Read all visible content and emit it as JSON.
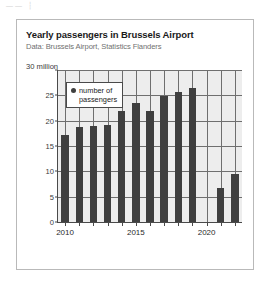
{
  "artifact": {
    "text": "——  ┆"
  },
  "chart_data": {
    "type": "bar",
    "title": "Yearly passengers in Brussels Airport",
    "subtitle": "Data: Brussels Airport, Statistics Flanders",
    "xlabel": "",
    "ylabel": "",
    "y_axis_unit_label": "30 million",
    "legend": {
      "position": "top-left-inside",
      "entries": [
        {
          "label_line1": "number of",
          "label_line2": "passengers",
          "marker": "dot",
          "color": "#3f3f3f"
        }
      ]
    },
    "categories": [
      2010,
      2011,
      2012,
      2013,
      2014,
      2015,
      2016,
      2017,
      2018,
      2019,
      2020,
      2021,
      2022
    ],
    "values": [
      17.2,
      18.8,
      18.9,
      19.1,
      22.0,
      23.5,
      21.9,
      24.8,
      25.7,
      26.4,
      0,
      6.8,
      9.5
    ],
    "series": [
      {
        "name": "number of passengers",
        "color": "#3f3f3f",
        "values": [
          17.2,
          18.8,
          18.9,
          19.1,
          22.0,
          23.5,
          21.9,
          24.8,
          25.7,
          26.4,
          0,
          6.8,
          9.5
        ]
      }
    ],
    "ylim": [
      0,
      30
    ],
    "yticks": [
      0,
      5,
      10,
      15,
      20,
      25,
      30
    ],
    "ytick_labels": [
      "0",
      "5",
      "10",
      "15",
      "20",
      "25",
      "30 million"
    ],
    "xticks": [
      2010,
      2015,
      2020
    ],
    "xtick_labels": [
      "2010",
      "2015",
      "2020"
    ],
    "grid": true,
    "grid_color": "#6f6f6f",
    "plot_background": "#ededed"
  }
}
